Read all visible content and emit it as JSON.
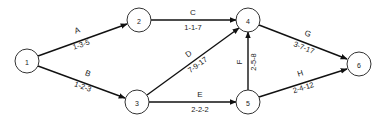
{
  "diagram": {
    "type": "activity-on-arrow network",
    "nodes": [
      {
        "id": "1",
        "label": "1",
        "x": 27,
        "y": 61
      },
      {
        "id": "2",
        "label": "2",
        "x": 139,
        "y": 20
      },
      {
        "id": "3",
        "label": "3",
        "x": 137,
        "y": 102
      },
      {
        "id": "4",
        "label": "4",
        "x": 248,
        "y": 20
      },
      {
        "id": "5",
        "label": "5",
        "x": 248,
        "y": 102
      },
      {
        "id": "6",
        "label": "6",
        "x": 359,
        "y": 64
      }
    ],
    "edges": [
      {
        "id": "A",
        "name": "A",
        "estimate": "1-3-5",
        "from": "1",
        "to": "2"
      },
      {
        "id": "B",
        "name": "B",
        "estimate": "1-2-3",
        "from": "1",
        "to": "3"
      },
      {
        "id": "C",
        "name": "C",
        "estimate": "1-1-7",
        "from": "2",
        "to": "4"
      },
      {
        "id": "D",
        "name": "D",
        "estimate": "7-9-17",
        "from": "3",
        "to": "4"
      },
      {
        "id": "E",
        "name": "E",
        "estimate": "2-2-2",
        "from": "3",
        "to": "5"
      },
      {
        "id": "F",
        "name": "F",
        "estimate": "2-5-8",
        "from": "5",
        "to": "4"
      },
      {
        "id": "G",
        "name": "G",
        "estimate": "3-7-17",
        "from": "4",
        "to": "6"
      },
      {
        "id": "H",
        "name": "H",
        "estimate": "2-4-12",
        "from": "5",
        "to": "6"
      }
    ]
  }
}
